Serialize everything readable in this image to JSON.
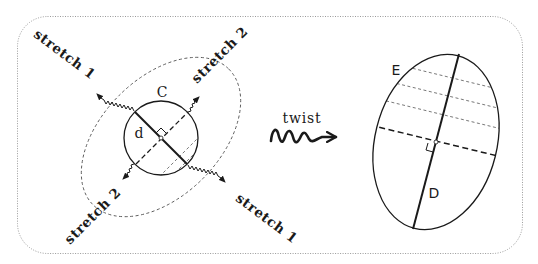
{
  "figure": {
    "frame": {
      "style": "dotted rounded rectangle",
      "color": "#9a9a9a"
    },
    "left_panel": {
      "circle_label": "C",
      "diameter_label": "d",
      "stretch_labels": [
        {
          "id": "upper-left",
          "text": "stretch 1"
        },
        {
          "id": "upper-right",
          "text": "stretch 2"
        },
        {
          "id": "lower-left",
          "text": "stretch 2"
        },
        {
          "id": "lower-right",
          "text": "stretch 1"
        }
      ]
    },
    "transition": {
      "label": "twist"
    },
    "right_panel": {
      "ellipse_label": "E",
      "axis_label": "D"
    },
    "colors": {
      "ink": "#1a1a1a",
      "dashed": "#555555",
      "frame": "#9a9a9a"
    }
  }
}
